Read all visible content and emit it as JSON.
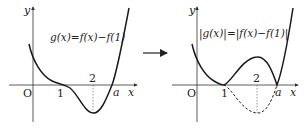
{
  "arrow": {
    "direction": "right"
  },
  "left_graph": {
    "equation": "g(x)=f(x)−f(1)",
    "axis_labels": {
      "x": "x",
      "y": "y",
      "origin": "O"
    },
    "ticks": {
      "one": "1",
      "two": "2",
      "a": "a"
    },
    "description": "Curve of g(x): decreasing, tangent to x-axis with inflection at x=1, minimum below axis at x=2, crosses x-axis at x=a"
  },
  "right_graph": {
    "equation": "|g(x)|=|f(x)−f(1)|",
    "axis_labels": {
      "x": "x",
      "y": "y",
      "origin": "O"
    },
    "ticks": {
      "one": "1",
      "two": "2",
      "a": "a"
    },
    "description": "Curve of |g(x)|: part below the x-axis between 1 and a is reflected above (solid), original part shown dashed"
  },
  "colors": {
    "curve": "#1a1a1a",
    "axis": "#333333",
    "guide": "#555555"
  }
}
